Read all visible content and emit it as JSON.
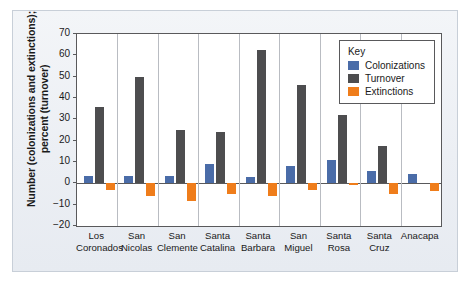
{
  "figure": {
    "y_axis_title_line1": "Number (colonizations and extinctions);",
    "y_axis_title_line2": "percent (turnover)"
  },
  "legend": {
    "title": "Key",
    "entries": [
      {
        "label": "Colonizations",
        "color": "#4a6ca8"
      },
      {
        "label": "Turnover",
        "color": "#4d4d4f"
      },
      {
        "label": "Extinctions",
        "color": "#ef7d1b"
      }
    ]
  },
  "chart_data": {
    "type": "bar",
    "title": "",
    "xlabel": "",
    "ylabel": "Number (colonizations and extinctions); percent (turnover)",
    "ylim": [
      -20,
      70
    ],
    "yticks": [
      70,
      60,
      50,
      40,
      30,
      20,
      10,
      0,
      "−10",
      "−20"
    ],
    "ytick_values": [
      70,
      60,
      50,
      40,
      30,
      20,
      10,
      0,
      -10,
      -20
    ],
    "grid": false,
    "legend_position": "top-right",
    "categories": [
      "Los Coronados",
      "San Nicolas",
      "San Clemente",
      "Santa Catalina",
      "Santa Barbara",
      "San Miguel",
      "Santa Rosa",
      "Santa Cruz",
      "Anacapa"
    ],
    "category_lines": [
      [
        "Los",
        "Coronados"
      ],
      [
        "San",
        "Nicolas"
      ],
      [
        "San",
        "Clemente"
      ],
      [
        "Santa",
        "Catalina"
      ],
      [
        "Santa",
        "Barbara"
      ],
      [
        "San",
        "Miguel"
      ],
      [
        "Santa",
        "Rosa"
      ],
      [
        "Santa",
        "Cruz"
      ],
      [
        "Anacapa",
        ""
      ]
    ],
    "series": [
      {
        "name": "Colonizations",
        "color": "#4a6ca8",
        "values": [
          3.5,
          3.5,
          3.5,
          9,
          3,
          8,
          11,
          6,
          4.5
        ]
      },
      {
        "name": "Turnover",
        "color": "#4d4d4f",
        "values": [
          36,
          50,
          25,
          24,
          62.5,
          46,
          32,
          17.5,
          0
        ]
      },
      {
        "name": "Extinctions",
        "color": "#ef7d1b",
        "values": [
          -3,
          -6,
          -8.5,
          -5,
          -6,
          -3,
          -0.7,
          -5,
          -3.5
        ]
      }
    ]
  }
}
